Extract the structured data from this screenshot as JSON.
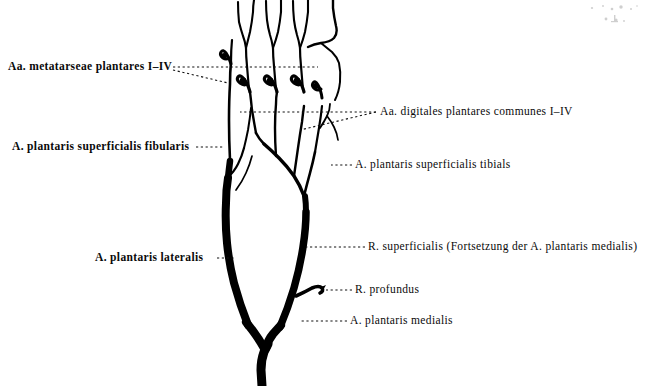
{
  "figure": {
    "background_color": "#ffffff",
    "ink_color": "#000000",
    "width": 649,
    "height": 386
  },
  "labels": {
    "metatarseae": "Aa. metatarseae plantares I–IV",
    "fibularis": "A. plantaris superficialis fibularis",
    "lateralis": "A. plantaris lateralis",
    "digitales": "Aa. digitales plantares communes I–IV",
    "tibials": "A. plantaris superficialis tibials",
    "r_superficialis": "R. superficialis (Fortsetzung der A. plantaris medialis)",
    "r_profundus": "R. profundus",
    "medialis": "A. plantaris medialis"
  },
  "leader_lines": {
    "style": "dotted",
    "color": "#111111"
  },
  "structures": [
    {
      "name": "aa-digitales-plantares-communes",
      "count": 4,
      "region": "top"
    },
    {
      "name": "aa-metatarseae-plantares",
      "count": 4,
      "region": "upper"
    },
    {
      "name": "a-plantaris-superficialis-fibularis",
      "region": "left-mid"
    },
    {
      "name": "a-plantaris-superficialis-tibials",
      "region": "right-mid"
    },
    {
      "name": "a-plantaris-lateralis",
      "region": "left-trunk"
    },
    {
      "name": "r-superficialis",
      "region": "right-trunk"
    },
    {
      "name": "r-profundus",
      "region": "right-hook"
    },
    {
      "name": "a-plantaris-medialis",
      "region": "lower-stem"
    }
  ]
}
